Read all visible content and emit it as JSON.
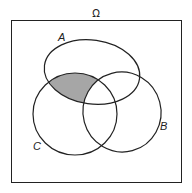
{
  "diagram": {
    "type": "venn",
    "universe_label": "Ω",
    "sets": [
      {
        "name": "A",
        "label": "A"
      },
      {
        "name": "B",
        "label": "B"
      },
      {
        "name": "C",
        "label": "C"
      }
    ],
    "shaded_region": "A ∩ C ∩ Bᶜ",
    "colors": {
      "outline": "#222222",
      "shade": "#a6a6a6",
      "background": "#ffffff"
    }
  }
}
